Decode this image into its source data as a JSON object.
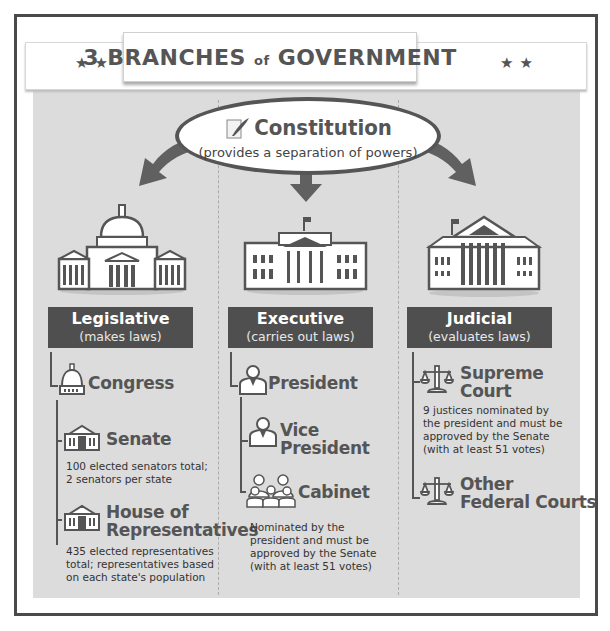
{
  "header": {
    "title_part1": "3 BRANCHES",
    "title_of": "of",
    "title_part2": "GOVERNMENT",
    "stars_left": "★★",
    "stars_right": "★★"
  },
  "constitution": {
    "icon": "scroll-quill-icon",
    "title": "Constitution",
    "subtitle": "(provides a separation of powers)"
  },
  "branches": [
    {
      "name": "Legislative",
      "role": "(makes laws)",
      "building_icon": "capitol-building-icon",
      "items": [
        {
          "label": "Congress",
          "icon": "capitol-dome-icon"
        },
        {
          "label": "Senate",
          "icon": "senate-building-icon",
          "desc": [
            "100 elected senators total;",
            "2 senators per state"
          ]
        },
        {
          "label_line1": "House of",
          "label_line2": "Representatives",
          "icon": "house-building-icon",
          "desc": [
            "435 elected representatives",
            "total; representatives based",
            "on each state's population"
          ]
        }
      ]
    },
    {
      "name": "Executive",
      "role": "(carries out laws)",
      "building_icon": "white-house-icon",
      "items": [
        {
          "label": "President",
          "icon": "person-icon"
        },
        {
          "label_line1": "Vice",
          "label_line2": "President",
          "icon": "person-icon"
        },
        {
          "label": "Cabinet",
          "icon": "group-icon",
          "desc": [
            "Nominated by the",
            "president and must be",
            "approved by the Senate",
            "(with at least 51 votes)"
          ]
        }
      ]
    },
    {
      "name": "Judicial",
      "role": "(evaluates laws)",
      "building_icon": "supreme-court-icon",
      "items": [
        {
          "label_line1": "Supreme",
          "label_line2": "Court",
          "icon": "scales-icon",
          "desc": [
            "9 justices nominated by",
            "the president and must be",
            "approved by the Senate",
            "(with at least 51 votes)"
          ]
        },
        {
          "label_line1": "Other",
          "label_line2": "Federal Courts",
          "icon": "scales-icon"
        }
      ]
    }
  ],
  "colors": {
    "header_bg": "#4f4f4f",
    "panel_bg": "#dcdcdc",
    "text_dark": "#555555",
    "frame": "#4a4a4a"
  }
}
